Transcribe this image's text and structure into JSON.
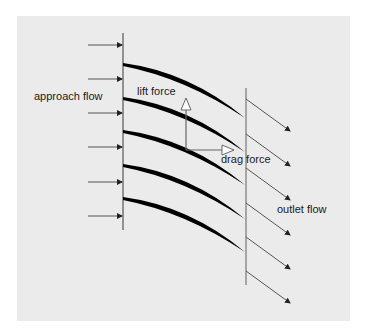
{
  "diagram": {
    "type": "blade cascade flow diagram",
    "labels": {
      "approach_flow": "approach flow",
      "lift_force": "lift force",
      "drag_force": "drag force",
      "outlet_flow": "outlet flow"
    },
    "colors": {
      "background_panel": "#ebebeb",
      "blade": "#000000",
      "lines": "#555555",
      "text": "#1a1a1a"
    },
    "blade_count": 5,
    "inlet_arrow_count": 6,
    "outlet_arrow_count": 6
  }
}
